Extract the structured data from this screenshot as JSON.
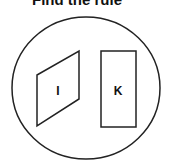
{
  "title": "Find the rule",
  "shapes": [
    {
      "type": "parallelogram",
      "label": "I"
    },
    {
      "type": "rectangle",
      "label": "K"
    }
  ],
  "colors": {
    "stroke": "#222222",
    "background": "#ffffff"
  }
}
